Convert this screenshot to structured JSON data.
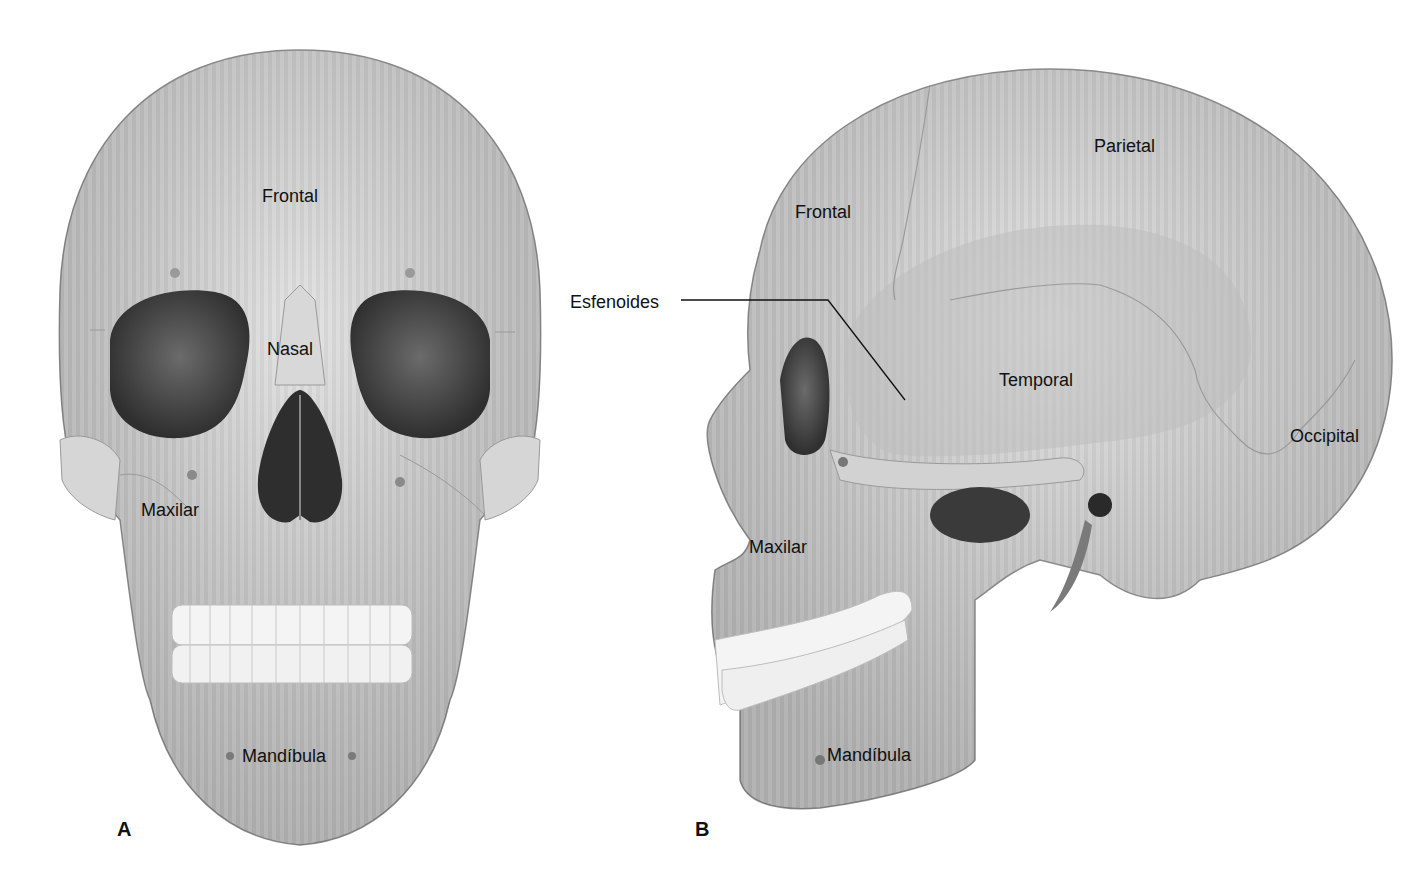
{
  "figure": {
    "panels": [
      {
        "id": "A",
        "letter": "A",
        "view": "anterior",
        "labels": {
          "frontal": "Frontal",
          "nasal": "Nasal",
          "maxilar": "Maxilar",
          "mandibula": "Mandíbula"
        }
      },
      {
        "id": "B",
        "letter": "B",
        "view": "lateral",
        "labels": {
          "frontal": "Frontal",
          "parietal": "Parietal",
          "esfenoides": "Esfenoides",
          "temporal": "Temporal",
          "occipital": "Occipital",
          "maxilar": "Maxilar",
          "mandibula": "Mandíbula"
        }
      }
    ],
    "colors": {
      "bone_light": "#d9d9d9",
      "bone_mid": "#b8b8b8",
      "bone_dark": "#8c8c8c",
      "cavity": "#3a3a3a",
      "teeth": "#f4f4f4",
      "suture": "#9a9a9a",
      "text": "#111111"
    }
  }
}
